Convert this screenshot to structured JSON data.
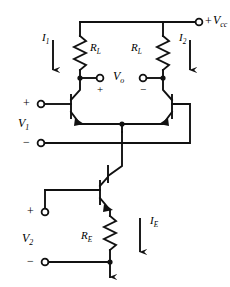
{
  "figure": {
    "kind": "circuit-schematic",
    "name": "emitter-coupled-differential-amplifier",
    "ink_color": "#111111",
    "background_color": "#ffffff"
  },
  "supply": {
    "sign": "+",
    "label_main": "V",
    "label_sub": "cc",
    "terminal": "open-circle"
  },
  "currents": {
    "i1": {
      "main": "I",
      "sub": "1"
    },
    "i2": {
      "main": "I",
      "sub": "2"
    },
    "ie": {
      "main": "I",
      "sub": "E"
    }
  },
  "resistors": {
    "rl_left": {
      "main": "R",
      "sub": "L"
    },
    "rl_right": {
      "main": "R",
      "sub": "L"
    },
    "re": {
      "main": "R",
      "sub": "E"
    }
  },
  "output": {
    "label_main": "V",
    "label_sub": "o",
    "plus": "+",
    "minus": "−"
  },
  "input1": {
    "label_main": "V",
    "label_sub": "1",
    "plus": "+",
    "minus": "−"
  },
  "input2": {
    "label_main": "V",
    "label_sub": "2",
    "plus": "+",
    "minus": "−"
  }
}
